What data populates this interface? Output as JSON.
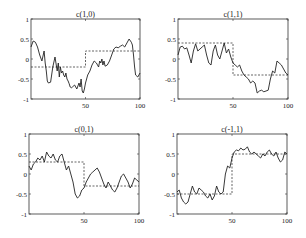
{
  "figure": {
    "width": 306,
    "height": 238
  },
  "chart_data": [
    {
      "type": "line",
      "title": "c(1,0)",
      "box": {
        "left": 31,
        "top": 19,
        "right": 140,
        "bottom": 99
      },
      "xlim": [
        0,
        100
      ],
      "ylim": [
        -1,
        1
      ],
      "xticks": [
        50,
        100
      ],
      "yticks": [
        -1,
        -0.5,
        0,
        0.5,
        1
      ],
      "xtick_labels": [
        "50",
        "100"
      ],
      "ytick_labels": [
        "-1",
        "-0.5",
        "0",
        "0.5",
        "1"
      ],
      "series": [
        {
          "name": "estimate",
          "style": "solid",
          "x": [
            0,
            2,
            4,
            6,
            8,
            10,
            12,
            13,
            14,
            15,
            16,
            18,
            20,
            22,
            24,
            25,
            26,
            27,
            28,
            29,
            30,
            31,
            32,
            33,
            34,
            35,
            36,
            37,
            38,
            40,
            42,
            44,
            45,
            46,
            47,
            48,
            49,
            50,
            52,
            54,
            56,
            58,
            60,
            62,
            63,
            64,
            65,
            66,
            67,
            68,
            70,
            72,
            74,
            76,
            78,
            80,
            82,
            84,
            86,
            88,
            90,
            92,
            93,
            94,
            95,
            96,
            98,
            100
          ],
          "y": [
            0.3,
            0.45,
            0.42,
            0.3,
            0.1,
            -0.05,
            0.2,
            -0.1,
            -0.3,
            -0.55,
            -0.6,
            -0.58,
            -0.2,
            0.05,
            -0.3,
            -0.1,
            -0.45,
            -0.2,
            -0.35,
            -0.3,
            -0.4,
            -0.45,
            -0.35,
            -0.5,
            -0.55,
            -0.62,
            -0.7,
            -0.72,
            -0.7,
            -0.65,
            -0.75,
            -0.6,
            -0.7,
            -0.5,
            -0.8,
            -0.85,
            -0.75,
            -0.6,
            -0.4,
            -0.3,
            -0.15,
            -0.05,
            -0.1,
            -0.2,
            -0.05,
            -0.1,
            0.0,
            -0.15,
            -0.05,
            -0.18,
            -0.15,
            -0.05,
            0.1,
            0.25,
            0.3,
            0.28,
            0.32,
            0.35,
            0.3,
            0.4,
            0.5,
            0.42,
            0.35,
            0.1,
            -0.2,
            -0.4,
            -0.45,
            -0.35
          ]
        },
        {
          "name": "true",
          "style": "dashed",
          "x": [
            0,
            50,
            50,
            100
          ],
          "y": [
            -0.2,
            -0.2,
            0.2,
            0.2
          ]
        }
      ]
    },
    {
      "type": "line",
      "title": "c(1,1)",
      "box": {
        "left": 178,
        "top": 19,
        "right": 288,
        "bottom": 99
      },
      "xlim": [
        0,
        100
      ],
      "ylim": [
        -1,
        1
      ],
      "xticks": [
        50,
        100
      ],
      "yticks": [
        -1,
        -0.5,
        0,
        0.5,
        1
      ],
      "xtick_labels": [
        "50",
        "100"
      ],
      "ytick_labels": [
        "-1",
        "-0.5",
        "0",
        "0.5",
        "1"
      ],
      "series": [
        {
          "name": "estimate",
          "style": "solid",
          "x": [
            0,
            2,
            4,
            6,
            8,
            10,
            12,
            14,
            16,
            18,
            20,
            22,
            24,
            26,
            28,
            30,
            32,
            34,
            36,
            38,
            40,
            42,
            44,
            46,
            48,
            50,
            52,
            54,
            56,
            58,
            60,
            62,
            64,
            66,
            68,
            70,
            72,
            74,
            76,
            78,
            80,
            82,
            84,
            86,
            88,
            90,
            92,
            94,
            96,
            98,
            100
          ],
          "y": [
            0.1,
            0.3,
            0.32,
            0.25,
            0.28,
            0.1,
            -0.1,
            0.2,
            0.38,
            0.2,
            0.25,
            0.3,
            0.35,
            0.1,
            -0.1,
            -0.15,
            0.2,
            0.35,
            0.1,
            0.0,
            0.2,
            0.4,
            0.15,
            0.25,
            0.05,
            -0.1,
            -0.15,
            -0.2,
            -0.15,
            -0.3,
            -0.4,
            -0.45,
            -0.5,
            -0.6,
            -0.55,
            -0.6,
            -0.85,
            -0.8,
            -0.78,
            -0.82,
            -0.8,
            -0.78,
            -0.5,
            -0.3,
            -0.35,
            -0.05,
            -0.1,
            -0.15,
            -0.25,
            -0.35,
            -0.4
          ]
        },
        {
          "name": "true",
          "style": "dashed",
          "x": [
            0,
            50,
            50,
            100
          ],
          "y": [
            0.4,
            0.4,
            -0.4,
            -0.4
          ]
        }
      ]
    },
    {
      "type": "line",
      "title": "c(0,1)",
      "box": {
        "left": 29,
        "top": 134,
        "right": 139,
        "bottom": 214
      },
      "xlim": [
        0,
        100
      ],
      "ylim": [
        -1,
        1
      ],
      "xticks": [
        50,
        100
      ],
      "yticks": [
        -1,
        -0.5,
        0,
        0.5,
        1
      ],
      "xtick_labels": [
        "50",
        "100"
      ],
      "ytick_labels": [
        "-1",
        "-0.5",
        "0",
        "0.5",
        "1"
      ],
      "series": [
        {
          "name": "estimate",
          "style": "solid",
          "x": [
            0,
            2,
            4,
            6,
            8,
            10,
            12,
            14,
            16,
            18,
            20,
            22,
            24,
            26,
            28,
            30,
            32,
            34,
            36,
            38,
            40,
            42,
            44,
            46,
            48,
            50,
            52,
            54,
            56,
            58,
            60,
            62,
            64,
            66,
            68,
            70,
            72,
            74,
            76,
            78,
            80,
            82,
            84,
            86,
            88,
            90,
            92,
            94,
            96,
            98,
            100
          ],
          "y": [
            0.2,
            0.1,
            0.25,
            0.3,
            0.4,
            0.35,
            0.45,
            0.3,
            0.55,
            0.45,
            0.4,
            0.5,
            0.35,
            0.3,
            0.45,
            0.5,
            0.3,
            0.1,
            0.2,
            0.0,
            -0.2,
            -0.5,
            -0.6,
            -0.55,
            -0.4,
            -0.35,
            -0.2,
            -0.1,
            0.0,
            0.05,
            0.1,
            0.15,
            0.05,
            -0.1,
            -0.25,
            -0.35,
            -0.2,
            -0.3,
            -0.4,
            -0.45,
            -0.35,
            -0.2,
            -0.05,
            0.0,
            -0.1,
            -0.2,
            -0.35,
            -0.25,
            -0.1,
            -0.15,
            -0.2
          ]
        },
        {
          "name": "true",
          "style": "dashed",
          "x": [
            0,
            50,
            50,
            100
          ],
          "y": [
            0.3,
            0.3,
            -0.3,
            -0.3
          ]
        }
      ]
    },
    {
      "type": "line",
      "title": "c(-1,1)",
      "box": {
        "left": 177,
        "top": 134,
        "right": 287,
        "bottom": 214
      },
      "xlim": [
        0,
        100
      ],
      "ylim": [
        -1,
        1
      ],
      "xticks": [
        50,
        100
      ],
      "yticks": [
        -1,
        -0.5,
        0,
        0.5,
        1
      ],
      "xtick_labels": [
        "50",
        "100"
      ],
      "ytick_labels": [
        "-1",
        "-0.5",
        "0",
        "0.5",
        "1"
      ],
      "series": [
        {
          "name": "estimate",
          "style": "solid",
          "x": [
            0,
            2,
            4,
            6,
            8,
            10,
            12,
            14,
            16,
            18,
            20,
            22,
            24,
            26,
            28,
            30,
            32,
            34,
            36,
            38,
            40,
            42,
            44,
            46,
            48,
            50,
            52,
            54,
            56,
            58,
            60,
            62,
            64,
            66,
            68,
            70,
            72,
            74,
            76,
            78,
            80,
            82,
            84,
            86,
            88,
            90,
            92,
            94,
            96,
            98,
            100
          ],
          "y": [
            -0.45,
            -0.4,
            -0.6,
            -0.7,
            -0.75,
            -0.7,
            -0.5,
            -0.3,
            -0.45,
            -0.5,
            -0.35,
            -0.4,
            -0.45,
            -0.55,
            -0.6,
            -0.5,
            -0.65,
            -0.55,
            -0.3,
            -0.45,
            -0.5,
            -0.45,
            0.0,
            0.2,
            0.15,
            0.4,
            0.55,
            0.6,
            0.58,
            0.65,
            0.6,
            0.62,
            0.68,
            0.55,
            0.5,
            0.55,
            0.5,
            0.45,
            0.4,
            0.5,
            0.45,
            0.55,
            0.6,
            0.5,
            0.45,
            0.55,
            0.4,
            0.3,
            0.35,
            0.55,
            0.5
          ]
        },
        {
          "name": "true",
          "style": "dashed",
          "x": [
            0,
            50,
            50,
            100
          ],
          "y": [
            -0.5,
            -0.5,
            0.5,
            0.5
          ]
        }
      ]
    }
  ]
}
